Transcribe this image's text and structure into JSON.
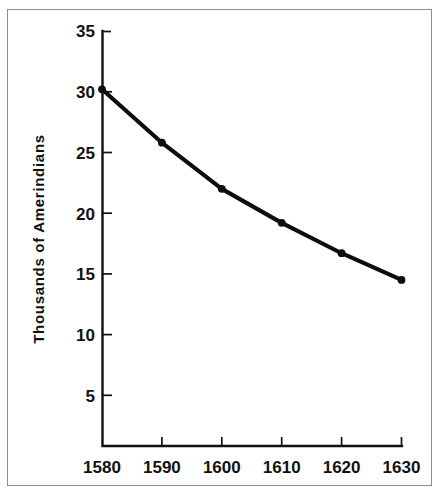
{
  "chart_data": {
    "type": "line",
    "title": "",
    "xlabel": "",
    "ylabel": "Thousands of Amerindians",
    "x": [
      1580,
      1590,
      1600,
      1610,
      1620,
      1630
    ],
    "values": [
      30.2,
      25.8,
      22.0,
      19.2,
      16.7,
      14.5
    ],
    "series": [
      {
        "name": "Amerindian population",
        "values": [
          30.2,
          25.8,
          22.0,
          19.2,
          16.7,
          14.5
        ]
      }
    ],
    "xlim": [
      1580,
      1630
    ],
    "ylim": [
      0,
      35
    ],
    "xticks": [
      "1580",
      "1590",
      "1600",
      "1610",
      "1620",
      "1630"
    ],
    "yticks": [
      "5",
      "10",
      "15",
      "20",
      "25",
      "30",
      "35"
    ],
    "grid": false,
    "legend": "none",
    "markers": "filled-circle",
    "line_color": "#0d0d0d",
    "frame_color": "#8d8d8d",
    "background_color": "#ffffff"
  },
  "axes": {
    "y_axis_title": "Thousands of Amerindians",
    "y_tick_labels": [
      "35",
      "30",
      "25",
      "20",
      "15",
      "10",
      "5"
    ],
    "x_tick_labels": [
      "1580",
      "1590",
      "1600",
      "1610",
      "1620",
      "1630"
    ]
  }
}
